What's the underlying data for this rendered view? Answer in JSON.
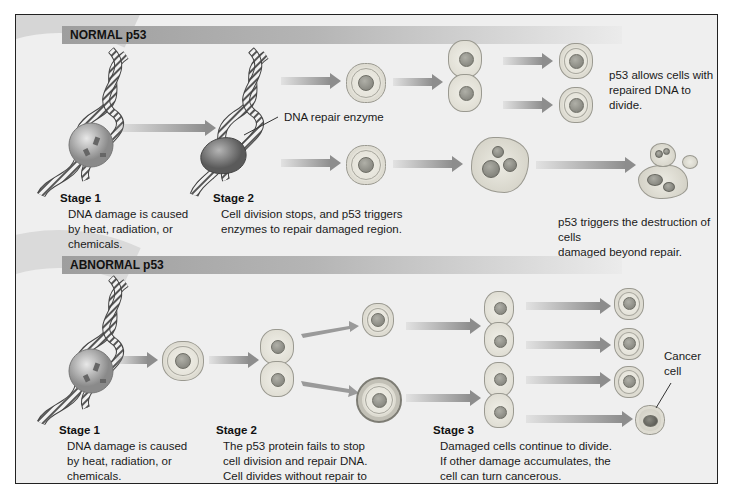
{
  "figure": {
    "colors": {
      "background": "#efefef",
      "section_bar": "#9e9e9e",
      "arrow": "#8d8d8d",
      "cell_fill": "#e2e0d6",
      "nucleus": "#7b7b74",
      "border": "#222222"
    }
  },
  "normal": {
    "header": "NORMAL p53",
    "enzyme_label": "DNA repair enzyme",
    "stage1": {
      "title": "Stage 1",
      "lines": [
        "DNA damage is caused",
        "by heat, radiation, or",
        "chemicals."
      ]
    },
    "stage2": {
      "title": "Stage 2",
      "lines": [
        "Cell division stops, and p53 triggers",
        "enzymes to repair damaged region."
      ]
    },
    "outcome_repair": {
      "lines": [
        "p53 allows cells with",
        "repaired DNA to divide."
      ]
    },
    "outcome_destroy": {
      "lines": [
        "p53 triggers the destruction of cells",
        "damaged beyond repair."
      ]
    }
  },
  "abnormal": {
    "header": "ABNORMAL p53",
    "stage1": {
      "title": "Stage 1",
      "lines": [
        "DNA damage is caused",
        "by heat, radiation, or",
        "chemicals."
      ]
    },
    "stage2": {
      "title": "Stage 2",
      "lines": [
        "The p53 protein fails to stop",
        "cell division and repair DNA.",
        "Cell divides without repair to",
        "damaged DNA."
      ]
    },
    "stage3": {
      "title": "Stage 3",
      "lines": [
        "Damaged cells continue to divide.",
        "If other damage accumulates, the",
        "cell can turn cancerous."
      ]
    },
    "cancer_label": {
      "lines": [
        "Cancer",
        "cell"
      ]
    }
  },
  "icons": {
    "dna": "dna-helix-icon",
    "damage": "dna-damage-sphere-icon",
    "enzyme": "repair-enzyme-icon",
    "cell": "cell-icon",
    "dividing_cell": "dividing-cell-icon",
    "apoptotic_cell": "apoptotic-cell-icon",
    "cancer_cell": "cancer-cell-icon",
    "arrow": "arrow-right-icon"
  }
}
